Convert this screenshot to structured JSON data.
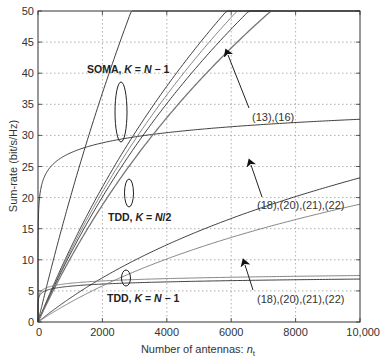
{
  "chart_data": {
    "type": "line",
    "title": "",
    "xlabel": "Number of antennas: n_t",
    "xlabel_main": "Number of antennas: ",
    "xlabel_var": "n",
    "xlabel_sub": "t",
    "ylabel": "Sum-rate (bit/s/Hz)",
    "xlim": [
      0,
      10000
    ],
    "ylim": [
      0,
      50
    ],
    "grid": true,
    "x_ticks": [
      0,
      2000,
      4000,
      6000,
      8000,
      10000
    ],
    "x_tick_labels": [
      "0",
      "2000",
      "4000",
      "6000",
      "8000",
      "10,000"
    ],
    "y_ticks": [
      0,
      5,
      10,
      15,
      20,
      25,
      30,
      35,
      40,
      45,
      50
    ],
    "y_tick_labels": [
      "0",
      "5",
      "10",
      "15",
      "20",
      "25",
      "30",
      "35",
      "40",
      "45",
      "50"
    ],
    "x": [
      0,
      2000,
      10000
    ],
    "series": [
      {
        "name": "SOMA, K=N-1 (13)",
        "group": "soma",
        "values": [
          0,
          36.8,
          46.1
        ]
      },
      {
        "name": "SOMA, K=N-1 (16)",
        "group": "soma",
        "values": [
          0,
          28.8,
          38.4
        ]
      },
      {
        "name": "TDD, K=N/2 (18)",
        "group": "tdd_half",
        "values": [
          0,
          21.7,
          26.0
        ]
      },
      {
        "name": "TDD, K=N/2 (20)",
        "group": "tdd_half",
        "values": [
          0,
          20.9,
          25.6
        ]
      },
      {
        "name": "TDD, K=N/2 (21)",
        "group": "tdd_half",
        "values": [
          0,
          20.1,
          24.8
        ]
      },
      {
        "name": "TDD, K=N/2 (22)",
        "group": "tdd_half",
        "values": [
          0,
          18.8,
          23.3
        ]
      },
      {
        "name": "TDD, K=N-1 (18)",
        "group": "tdd_full",
        "values": [
          0,
          7.1,
          8.8
        ]
      },
      {
        "name": "TDD, K=N-1 (20)",
        "group": "tdd_full",
        "values": [
          0,
          6.6,
          8.5
        ]
      },
      {
        "name": "TDD, K=N-1 (21)",
        "group": "tdd_full",
        "values": [
          0,
          6.1,
          7.9
        ]
      },
      {
        "name": "TDD, K=N-1 (22)",
        "group": "tdd_full",
        "values": [
          0,
          5.8,
          7.4
        ]
      }
    ],
    "annotations": [
      {
        "text_pre": "SOMA, ",
        "text_var": "K",
        "text_eq": " = ",
        "text_rhs_var": "N",
        "text_rhs": " − 1",
        "kind": "group-label",
        "x": 87,
        "y": 73
      },
      {
        "text_pre": "TDD, ",
        "text_var": "K",
        "text_eq": " = ",
        "text_rhs_var": "N",
        "text_rhs": "/2",
        "kind": "group-label",
        "x": 108,
        "y": 221
      },
      {
        "text_pre": "TDD, ",
        "text_var": "K",
        "text_eq": " = ",
        "text_rhs_var": "N",
        "text_rhs": " − 1",
        "kind": "group-label",
        "x": 107,
        "y": 302
      },
      {
        "text": "(13),(16)",
        "kind": "equation-ref",
        "x": 252,
        "y": 121
      },
      {
        "text": "(18),(20),(21),(22)",
        "kind": "equation-ref",
        "x": 257,
        "y": 209
      },
      {
        "text": "(18),(20),(21),(22)",
        "kind": "equation-ref",
        "x": 257,
        "y": 303
      }
    ]
  },
  "colors": {
    "axis": "#333333",
    "grid": "#9a9a9a",
    "curve_dark": "#2a2a2a",
    "curve_light": "#777777",
    "background": "#ffffff"
  }
}
